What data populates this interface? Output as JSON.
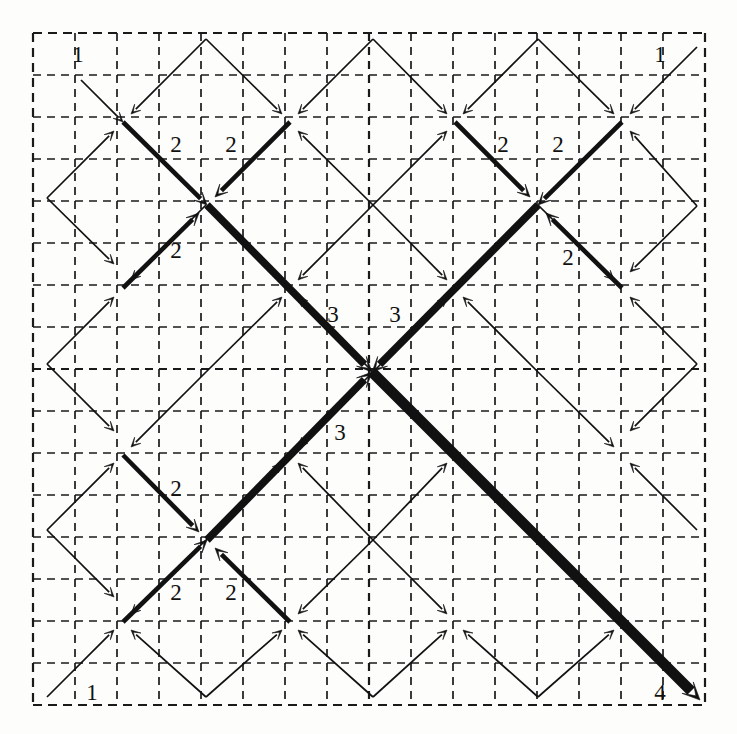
{
  "figure": {
    "canvas": {
      "width": 737,
      "height": 734
    },
    "colors": {
      "background": "#fdfdfc",
      "ink": "#111111",
      "grid": "#1a1a1a"
    }
  },
  "grid": {
    "name": "dashed-grid",
    "origin_x": 33,
    "origin_y": 33,
    "cell": 42,
    "divisions": 16,
    "node_spacing": 83.25,
    "border_dash": "9,6",
    "inner_dash": "8,6",
    "border_width": 2.2,
    "inner_width": 1.7,
    "midline_width": 2.2
  },
  "weights": {
    "labels": [
      "1",
      "2",
      "3",
      "4"
    ],
    "stroke_widths": [
      1.7,
      4.6,
      7.6,
      10.6
    ],
    "head_sizes": [
      9.5,
      12.5,
      15.0,
      17.5
    ]
  },
  "nodes": {
    "center": {
      "x": 372,
      "y": 372,
      "level": 4
    },
    "level2": [
      {
        "x": 207,
        "y": 205
      },
      {
        "x": 538,
        "y": 205
      },
      {
        "x": 207,
        "y": 540
      },
      {
        "x": 538,
        "y": 540
      }
    ],
    "level1": [
      {
        "x": 123,
        "y": 122
      },
      {
        "x": 290,
        "y": 122
      },
      {
        "x": 455,
        "y": 122
      },
      {
        "x": 622,
        "y": 122
      },
      {
        "x": 123,
        "y": 288
      },
      {
        "x": 290,
        "y": 288
      },
      {
        "x": 455,
        "y": 288
      },
      {
        "x": 622,
        "y": 288
      },
      {
        "x": 123,
        "y": 455
      },
      {
        "x": 290,
        "y": 455
      },
      {
        "x": 455,
        "y": 455
      },
      {
        "x": 622,
        "y": 455
      },
      {
        "x": 123,
        "y": 622
      },
      {
        "x": 290,
        "y": 622
      },
      {
        "x": 455,
        "y": 622
      },
      {
        "x": 622,
        "y": 622
      }
    ]
  },
  "edge_labels": [
    {
      "text": "1",
      "x": 78,
      "y": 62,
      "name": "weight-label-1-top-left"
    },
    {
      "text": "1",
      "x": 660,
      "y": 62,
      "name": "weight-label-1-top-right"
    },
    {
      "text": "1",
      "x": 92,
      "y": 700,
      "name": "weight-label-1-bottom-left"
    },
    {
      "text": "4",
      "x": 660,
      "y": 700,
      "name": "weight-label-4-bottom-right"
    },
    {
      "text": "2",
      "x": 176,
      "y": 152,
      "name": "weight-label-2-tl-a"
    },
    {
      "text": "2",
      "x": 231,
      "y": 152,
      "name": "weight-label-2-tl-b"
    },
    {
      "text": "2",
      "x": 176,
      "y": 258,
      "name": "weight-label-2-tl-c"
    },
    {
      "text": "2",
      "x": 503,
      "y": 152,
      "name": "weight-label-2-tr-a"
    },
    {
      "text": "2",
      "x": 558,
      "y": 152,
      "name": "weight-label-2-tr-b"
    },
    {
      "text": "2",
      "x": 568,
      "y": 265,
      "name": "weight-label-2-tr-c"
    },
    {
      "text": "2",
      "x": 176,
      "y": 496,
      "name": "weight-label-2-bl-a"
    },
    {
      "text": "2",
      "x": 176,
      "y": 600,
      "name": "weight-label-2-bl-b"
    },
    {
      "text": "2",
      "x": 231,
      "y": 600,
      "name": "weight-label-2-bl-c"
    },
    {
      "text": "3",
      "x": 333,
      "y": 322,
      "name": "weight-label-3-upper-left"
    },
    {
      "text": "3",
      "x": 395,
      "y": 322,
      "name": "weight-label-3-upper-right"
    },
    {
      "text": "3",
      "x": 340,
      "y": 440,
      "name": "weight-label-3-lower-left"
    }
  ],
  "edges": {
    "level1_into_level1_nodes": [
      {
        "from": [
          81,
          80
        ],
        "to": [
          123,
          122
        ],
        "name": "e1-nw-of-n00"
      },
      {
        "from": [
          206,
          39
        ],
        "to": [
          131,
          114
        ],
        "name": "e1-ne-of-n00"
      },
      {
        "from": [
          47,
          198
        ],
        "to": [
          114,
          131
        ],
        "name": "e1-sw-of-n00"
      },
      {
        "from": [
          206,
          39
        ],
        "to": [
          282,
          114
        ],
        "name": "e1-nw-of-n10"
      },
      {
        "from": [
          373,
          39
        ],
        "to": [
          298,
          114
        ],
        "name": "e1-ne-of-n10"
      },
      {
        "from": [
          373,
          205
        ],
        "to": [
          298,
          131
        ],
        "name": "e1-se-of-n10"
      },
      {
        "from": [
          373,
          39
        ],
        "to": [
          447,
          114
        ],
        "name": "e1-nw-of-n20"
      },
      {
        "from": [
          538,
          39
        ],
        "to": [
          463,
          114
        ],
        "name": "e1-ne-of-n20"
      },
      {
        "from": [
          373,
          205
        ],
        "to": [
          447,
          131
        ],
        "name": "e1-sw-of-n20"
      },
      {
        "from": [
          538,
          39
        ],
        "to": [
          614,
          114
        ],
        "name": "e1-nw-of-n30"
      },
      {
        "from": [
          697,
          47
        ],
        "to": [
          630,
          114
        ],
        "name": "e1-ne-of-n30"
      },
      {
        "from": [
          697,
          206
        ],
        "to": [
          630,
          131
        ],
        "name": "e1-se-of-n30"
      },
      {
        "from": [
          47,
          198
        ],
        "to": [
          114,
          264
        ],
        "name": "e1-nw-of-n01"
      },
      {
        "from": [
          206,
          205
        ],
        "to": [
          131,
          280
        ],
        "name": "e1-ne-of-n01"
      },
      {
        "from": [
          47,
          364
        ],
        "to": [
          114,
          297
        ],
        "name": "e1-sw-of-n01"
      },
      {
        "from": [
          373,
          205
        ],
        "to": [
          298,
          280
        ],
        "name": "e1-ne-of-n11"
      },
      {
        "from": [
          206,
          372
        ],
        "to": [
          282,
          297
        ],
        "name": "e1-sw-of-n11"
      },
      {
        "from": [
          373,
          372
        ],
        "to": [
          298,
          297
        ],
        "name": "e1-se-of-n11"
      },
      {
        "from": [
          373,
          205
        ],
        "to": [
          447,
          280
        ],
        "name": "e1-nw-of-n21"
      },
      {
        "from": [
          538,
          372
        ],
        "to": [
          463,
          297
        ],
        "name": "e1-se-of-n21"
      },
      {
        "from": [
          373,
          372
        ],
        "to": [
          447,
          297
        ],
        "name": "e1-sw-of-n21"
      },
      {
        "from": [
          697,
          206
        ],
        "to": [
          630,
          272
        ],
        "name": "e1-ne-of-n31"
      },
      {
        "from": [
          538,
          205
        ],
        "to": [
          614,
          280
        ],
        "name": "e1-nw-of-n31"
      },
      {
        "from": [
          697,
          364
        ],
        "to": [
          630,
          297
        ],
        "name": "e1-se-of-n31"
      },
      {
        "from": [
          47,
          364
        ],
        "to": [
          114,
          431
        ],
        "name": "e1-nw-of-n02"
      },
      {
        "from": [
          206,
          372
        ],
        "to": [
          131,
          447
        ],
        "name": "e1-ne-of-n02"
      },
      {
        "from": [
          47,
          530
        ],
        "to": [
          114,
          463
        ],
        "name": "e1-sw-of-n02"
      },
      {
        "from": [
          373,
          372
        ],
        "to": [
          298,
          447
        ],
        "name": "e1-ne-of-n12"
      },
      {
        "from": [
          206,
          540
        ],
        "to": [
          282,
          463
        ],
        "name": "e1-sw-of-n12"
      },
      {
        "from": [
          373,
          540
        ],
        "to": [
          298,
          463
        ],
        "name": "e1-se-of-n12"
      },
      {
        "from": [
          373,
          372
        ],
        "to": [
          447,
          447
        ],
        "name": "e1-nw-of-n22"
      },
      {
        "from": [
          538,
          540
        ],
        "to": [
          463,
          463
        ],
        "name": "e1-se-of-n22"
      },
      {
        "from": [
          373,
          540
        ],
        "to": [
          447,
          463
        ],
        "name": "e1-sw-of-n22"
      },
      {
        "from": [
          697,
          364
        ],
        "to": [
          630,
          431
        ],
        "name": "e1-ne-of-n32"
      },
      {
        "from": [
          538,
          372
        ],
        "to": [
          614,
          447
        ],
        "name": "e1-nw-of-n32"
      },
      {
        "from": [
          697,
          530
        ],
        "to": [
          630,
          463
        ],
        "name": "e1-se-of-n32"
      },
      {
        "from": [
          47,
          530
        ],
        "to": [
          114,
          597
        ],
        "name": "e1-nw-of-n03"
      },
      {
        "from": [
          206,
          540
        ],
        "to": [
          131,
          614
        ],
        "name": "e1-ne-of-n03"
      },
      {
        "from": [
          47,
          697
        ],
        "to": [
          114,
          630
        ],
        "name": "e1-sw-of-n03"
      },
      {
        "from": [
          206,
          697
        ],
        "to": [
          131,
          630
        ],
        "name": "e1-se-of-n03"
      },
      {
        "from": [
          373,
          540
        ],
        "to": [
          298,
          614
        ],
        "name": "e1-ne-of-n13"
      },
      {
        "from": [
          206,
          697
        ],
        "to": [
          282,
          630
        ],
        "name": "e1-sw-of-n13"
      },
      {
        "from": [
          373,
          697
        ],
        "to": [
          298,
          630
        ],
        "name": "e1-se-of-n13"
      },
      {
        "from": [
          373,
          540
        ],
        "to": [
          447,
          614
        ],
        "name": "e1-nw-of-n23"
      },
      {
        "from": [
          373,
          697
        ],
        "to": [
          447,
          630
        ],
        "name": "e1-sw-of-n23"
      },
      {
        "from": [
          538,
          697
        ],
        "to": [
          463,
          630
        ],
        "name": "e1-se-of-n23"
      },
      {
        "from": [
          538,
          540
        ],
        "to": [
          614,
          614
        ],
        "name": "e1-nw-of-n33"
      },
      {
        "from": [
          538,
          697
        ],
        "to": [
          614,
          630
        ],
        "name": "e1-sw-of-n33"
      }
    ],
    "level2_edges": [
      {
        "from": [
          123,
          122
        ],
        "to": [
          207,
          205
        ],
        "name": "e2-n00-to-c-tl"
      },
      {
        "from": [
          290,
          122
        ],
        "to": [
          215,
          197
        ],
        "name": "e2-n10-to-c-tl"
      },
      {
        "from": [
          123,
          288
        ],
        "to": [
          199,
          213
        ],
        "name": "e2-n01-to-c-tl"
      },
      {
        "from": [
          622,
          122
        ],
        "to": [
          538,
          205
        ],
        "name": "e2-n30-to-c-tr"
      },
      {
        "from": [
          455,
          122
        ],
        "to": [
          530,
          197
        ],
        "name": "e2-n20-to-c-tr"
      },
      {
        "from": [
          622,
          288
        ],
        "to": [
          546,
          213
        ],
        "name": "e2-n31-to-c-tr"
      },
      {
        "from": [
          123,
          622
        ],
        "to": [
          207,
          540
        ],
        "name": "e2-n03-to-c-bl"
      },
      {
        "from": [
          290,
          622
        ],
        "to": [
          215,
          548
        ],
        "name": "e2-n13-to-c-bl"
      },
      {
        "from": [
          123,
          455
        ],
        "to": [
          199,
          532
        ],
        "name": "e2-n02-to-c-bl"
      }
    ],
    "level3_edges": [
      {
        "from": [
          207,
          205
        ],
        "to": [
          372,
          372
        ],
        "name": "e3-tl-to-center"
      },
      {
        "from": [
          538,
          205
        ],
        "to": [
          372,
          372
        ],
        "name": "e3-tr-to-center"
      },
      {
        "from": [
          207,
          540
        ],
        "to": [
          372,
          372
        ],
        "name": "e3-bl-to-center"
      }
    ],
    "level4_edges": [
      {
        "from": [
          372,
          372
        ],
        "to": [
          700,
          700
        ],
        "name": "e4-center-to-exit"
      }
    ]
  }
}
